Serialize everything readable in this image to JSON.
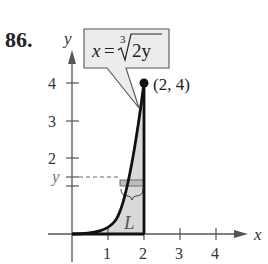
{
  "problem_number": "86.",
  "axes": {
    "x_label": "x",
    "y_label": "y",
    "x_ticks": [
      "1",
      "2",
      "3",
      "4"
    ],
    "y_ticks": [
      "2",
      "3",
      "4"
    ],
    "y_marker_label": "y"
  },
  "callout": {
    "lhs": "x =",
    "radical_index": "3",
    "radicand": "2y"
  },
  "point_label": "(2, 4)",
  "region_label": "L",
  "colors": {
    "curve": "#111111",
    "fill": "#d9d9d9",
    "axis": "#555555",
    "callout_bg": "#ececec",
    "strip": "#bdbdbd"
  }
}
